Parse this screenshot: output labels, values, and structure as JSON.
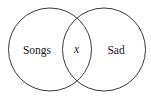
{
  "diagram": {
    "type": "venn",
    "background": "#ffffff",
    "stroke_color": "#3a3a3a",
    "sets": [
      {
        "id": "left",
        "label": "Songs",
        "cx": 50,
        "cy": 49.5,
        "r": 41.5
      },
      {
        "id": "right",
        "label": "Sad",
        "cx": 104,
        "cy": 49.5,
        "r": 41.5
      }
    ],
    "intersection": {
      "label": "x"
    }
  }
}
